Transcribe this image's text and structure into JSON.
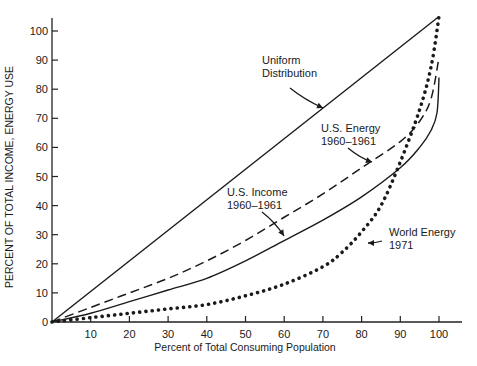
{
  "chart_data": {
    "type": "line",
    "title": "",
    "xlabel": "Percent of Total Consuming Population",
    "ylabel": "PERCENT OF TOTAL INCOME, ENERGY USE",
    "xlim": [
      0,
      105
    ],
    "ylim": [
      0,
      105
    ],
    "xticks": [
      10,
      20,
      30,
      40,
      50,
      60,
      70,
      80,
      90,
      100
    ],
    "yticks": [
      0,
      10,
      20,
      30,
      40,
      50,
      60,
      70,
      80,
      90,
      100
    ],
    "grid": false,
    "legend": "none (curves annotated directly with arrows)",
    "series": [
      {
        "name": "Uniform Distribution",
        "style": "solid",
        "x": [
          0,
          100
        ],
        "y": [
          0,
          105
        ]
      },
      {
        "name": "U.S. Energy 1960-1961",
        "style": "dashed",
        "x": [
          0,
          10,
          20,
          30,
          40,
          50,
          60,
          70,
          80,
          90,
          95,
          98,
          100
        ],
        "y": [
          0,
          5,
          10,
          15,
          21,
          28,
          36,
          44,
          53,
          62,
          69,
          77,
          91
        ]
      },
      {
        "name": "U.S. Income 1960-1961",
        "style": "solid",
        "x": [
          0,
          10,
          20,
          30,
          40,
          50,
          60,
          70,
          80,
          90,
          95,
          98,
          99.5,
          100
        ],
        "y": [
          0,
          3,
          7,
          11,
          15,
          21,
          28,
          35,
          43,
          53,
          60,
          66,
          72,
          84
        ]
      },
      {
        "name": "World Energy 1971",
        "style": "dotted",
        "x": [
          0,
          10,
          20,
          30,
          40,
          50,
          60,
          70,
          75,
          80,
          85,
          90,
          95,
          98,
          100
        ],
        "y": [
          0,
          1.5,
          3,
          4.5,
          6,
          9,
          13,
          19,
          24,
          31,
          40,
          55,
          73,
          88,
          105
        ]
      }
    ],
    "annotations": [
      {
        "text": [
          "Uniform",
          "Distribution"
        ],
        "target_series": "Uniform Distribution"
      },
      {
        "text": [
          "U.S. Energy",
          "1960–1961"
        ],
        "target_series": "U.S. Energy 1960-1961"
      },
      {
        "text": [
          "U.S. Income",
          "1960–1961"
        ],
        "target_series": "U.S. Income 1960-1961"
      },
      {
        "text": [
          "World Energy",
          "1971"
        ],
        "target_series": "World Energy 1971"
      }
    ]
  }
}
